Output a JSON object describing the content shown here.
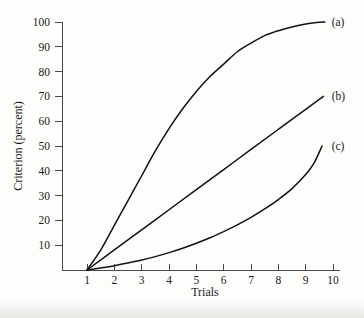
{
  "figure": {
    "background_color": "#fdfdfc",
    "line_color": "#121212",
    "axis_color": "#4a4a4a"
  },
  "chart_data": {
    "type": "line",
    "title": "",
    "subtitle": "",
    "xlabel": "Trials",
    "ylabel": "Criterion (percent)",
    "xlim": [
      0.6,
      10
    ],
    "ylim": [
      0,
      100
    ],
    "xticks": [
      1,
      2,
      3,
      4,
      5,
      6,
      7,
      8,
      9,
      10
    ],
    "xticklabels": [
      "1",
      "2",
      "3",
      "4",
      "5",
      "6",
      "7",
      "8",
      "9",
      "10"
    ],
    "yticks": [
      10,
      20,
      30,
      40,
      50,
      60,
      70,
      80,
      90,
      100
    ],
    "yticklabels": [
      "10",
      "20",
      "30",
      "40",
      "50",
      "60",
      "70",
      "80",
      "90",
      "100"
    ],
    "grid": false,
    "legend_position": "right-of-curve-end",
    "annotations": [
      {
        "text": "(a)",
        "x": 9.95,
        "y": 100,
        "note": "label for negatively accelerated curve"
      },
      {
        "text": "(b)",
        "x": 9.95,
        "y": 70,
        "note": "label for linear curve"
      },
      {
        "text": "(c)",
        "x": 9.95,
        "y": 50,
        "note": "label for positively accelerated curve"
      }
    ],
    "series": [
      {
        "name": "(a)",
        "shape": "negatively accelerated",
        "x": [
          1,
          1.5,
          2,
          2.5,
          3,
          3.5,
          4,
          4.5,
          5,
          5.5,
          6,
          6.5,
          7,
          7.5,
          8,
          8.5,
          9,
          9.4,
          9.7
        ],
        "values": [
          0,
          8,
          18,
          28,
          38,
          48,
          57,
          65,
          72,
          78,
          83,
          88,
          91.5,
          94.5,
          96.5,
          98,
          99.2,
          99.8,
          100
        ]
      },
      {
        "name": "(b)",
        "shape": "linear",
        "x": [
          1,
          2,
          3,
          4,
          5,
          6,
          7,
          8,
          9,
          9.65
        ],
        "values": [
          0,
          8.1,
          16.2,
          24.3,
          32.4,
          40.5,
          48.6,
          56.7,
          64.8,
          70
        ]
      },
      {
        "name": "(c)",
        "shape": "positively accelerated",
        "x": [
          1,
          1.5,
          2,
          2.5,
          3,
          3.5,
          4,
          4.5,
          5,
          5.5,
          6,
          6.5,
          7,
          7.5,
          8,
          8.5,
          9,
          9.3,
          9.6
        ],
        "values": [
          0,
          0.8,
          1.7,
          2.8,
          4.0,
          5.4,
          7.0,
          8.8,
          10.8,
          13.0,
          15.5,
          18.2,
          21.2,
          24.6,
          28.4,
          32.8,
          38.5,
          43.0,
          50
        ]
      }
    ]
  }
}
